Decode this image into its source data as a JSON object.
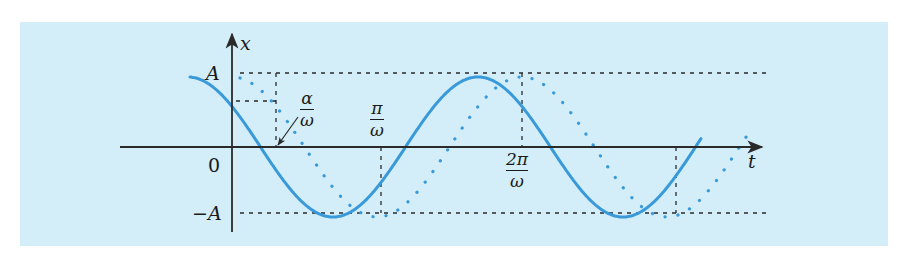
{
  "figure": {
    "background": "#d3eef8",
    "curve_color": "#3a9ad9",
    "axis_color": "#2a2a2a",
    "axes": {
      "y_label": "x",
      "x_label": "t",
      "origin_label": "0"
    },
    "y_levels": {
      "top": "A",
      "bottom": "−A"
    },
    "annotations": {
      "phase": {
        "num": "α",
        "den": "ω"
      },
      "half_period": {
        "num": "π",
        "den": "ω"
      },
      "period": {
        "num": "2π",
        "den": "ω"
      }
    },
    "curves": [
      {
        "name": "solid",
        "style": "solid",
        "equation": "x = A cos(ωt + α)"
      },
      {
        "name": "dotted",
        "style": "dotted",
        "equation": "x = A cos(ωt)"
      }
    ]
  }
}
